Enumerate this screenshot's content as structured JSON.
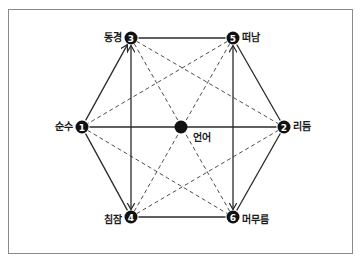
{
  "diagram": {
    "type": "hexagon-relationship",
    "center": {
      "id": "center",
      "label": "언어",
      "x": 181,
      "y": 127
    },
    "nodes": [
      {
        "id": "1",
        "number": "1",
        "label": "순수",
        "x": 82,
        "y": 127,
        "label_side": "left"
      },
      {
        "id": "2",
        "number": "2",
        "label": "리듬",
        "x": 284,
        "y": 127,
        "label_side": "right"
      },
      {
        "id": "3",
        "number": "3",
        "label": "동경",
        "x": 131,
        "y": 38,
        "label_side": "left"
      },
      {
        "id": "4",
        "number": "4",
        "label": "침잠",
        "x": 131,
        "y": 217,
        "label_side": "left"
      },
      {
        "id": "5",
        "number": "5",
        "label": "떠남",
        "x": 233,
        "y": 38,
        "label_side": "right"
      },
      {
        "id": "6",
        "number": "6",
        "label": "머무름",
        "x": 233,
        "y": 217,
        "label_side": "right"
      }
    ],
    "solid_edges": [
      {
        "from": "1",
        "to": "3",
        "arrow": "end"
      },
      {
        "from": "3",
        "to": "5",
        "arrow": "none"
      },
      {
        "from": "5",
        "to": "2",
        "arrow": "none"
      },
      {
        "from": "2",
        "to": "6",
        "arrow": "none"
      },
      {
        "from": "6",
        "to": "4",
        "arrow": "none"
      },
      {
        "from": "4",
        "to": "1",
        "arrow": "none"
      },
      {
        "from": "1",
        "to": "2",
        "arrow": "none"
      },
      {
        "from": "3",
        "to": "4",
        "arrow": "both"
      },
      {
        "from": "5",
        "to": "6",
        "arrow": "both"
      }
    ],
    "dashed_edges": [
      {
        "from": "3",
        "to": "2"
      },
      {
        "from": "5",
        "to": "1"
      },
      {
        "from": "1",
        "to": "6"
      },
      {
        "from": "4",
        "to": "2"
      },
      {
        "from": "3",
        "to": "6"
      },
      {
        "from": "5",
        "to": "4"
      }
    ],
    "colors": {
      "line": "#2a2a2a",
      "node": "#111111",
      "node_text": "#ffffff",
      "frame": "#8a8a8a"
    }
  }
}
